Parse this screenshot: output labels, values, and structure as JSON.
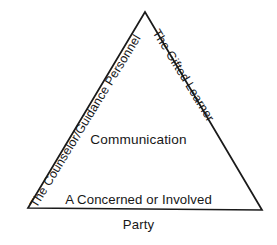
{
  "diagram": {
    "type": "triangle",
    "background_color": "#ffffff",
    "stroke_color": "#1a1a1a",
    "text_color": "#171717",
    "center_label": "Communication",
    "vertices": {
      "apex": [
        145,
        12
      ],
      "bottom_left": [
        28,
        208
      ],
      "bottom_right": [
        262,
        210
      ]
    },
    "edges": [
      {
        "name": "left-edge",
        "label": "The Counselor/Guidance Personnel",
        "rotation_deg": -58.5
      },
      {
        "name": "right-edge",
        "label": "The Gifted Learner",
        "rotation_deg": 58.3
      },
      {
        "name": "base-edge",
        "label_line1": "A Concerned or Involved",
        "label_line2": "Party"
      }
    ]
  }
}
